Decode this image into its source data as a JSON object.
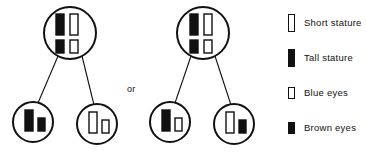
{
  "colors": {
    "stroke": "#111111",
    "dominant_fill": "#111111",
    "recessive_fill": "#ffffff",
    "background": "#ffffff"
  },
  "connector": {
    "or_label": "or"
  },
  "legend": {
    "items": [
      {
        "key": "short-stature",
        "label": "Short stature",
        "allele_type": "stature",
        "fill": "#ffffff",
        "swatch": "tall-bar-outline"
      },
      {
        "key": "tall-stature",
        "label": "Tall stature",
        "allele_type": "stature",
        "fill": "#111111",
        "swatch": "tall-bar-filled"
      },
      {
        "key": "blue-eyes",
        "label": "Blue eyes",
        "allele_type": "eye-color",
        "fill": "#ffffff",
        "swatch": "short-bar-outline"
      },
      {
        "key": "brown-eyes",
        "label": "Brown eyes",
        "allele_type": "eye-color",
        "fill": "#111111",
        "swatch": "short-bar-filled"
      }
    ]
  },
  "families": [
    {
      "key": "family-left",
      "parent": {
        "key": "parent-left",
        "cx": 70,
        "cy": 33,
        "r": 26,
        "chromosomes": [
          {
            "key": "stature-allele-1",
            "trait": "stature",
            "fill": "#111111",
            "x": 56,
            "y": 14,
            "w": 8,
            "h": 21
          },
          {
            "key": "stature-allele-2",
            "trait": "stature",
            "fill": "#ffffff",
            "x": 70,
            "y": 14,
            "w": 8,
            "h": 21
          },
          {
            "key": "eye-allele-1",
            "trait": "eye-color",
            "fill": "#111111",
            "x": 56,
            "y": 40,
            "w": 8,
            "h": 13
          },
          {
            "key": "eye-allele-2",
            "trait": "eye-color",
            "fill": "#ffffff",
            "x": 70,
            "y": 40,
            "w": 8,
            "h": 13
          }
        ]
      },
      "children": [
        {
          "key": "child-left-1",
          "cx": 33,
          "cy": 122,
          "r": 20,
          "chromosomes": [
            {
              "key": "stature-allele",
              "trait": "stature",
              "fill": "#111111",
              "x": 25,
              "y": 110,
              "w": 8,
              "h": 21
            },
            {
              "key": "eye-allele",
              "trait": "eye-color",
              "fill": "#111111",
              "x": 38,
              "y": 118,
              "w": 7,
              "h": 13
            }
          ]
        },
        {
          "key": "child-left-2",
          "cx": 97,
          "cy": 124,
          "r": 20,
          "chromosomes": [
            {
              "key": "stature-allele",
              "trait": "stature",
              "fill": "#ffffff",
              "x": 89,
              "y": 112,
              "w": 8,
              "h": 21
            },
            {
              "key": "eye-allele",
              "trait": "eye-color",
              "fill": "#ffffff",
              "x": 102,
              "y": 120,
              "w": 7,
              "h": 13
            }
          ]
        }
      ]
    },
    {
      "key": "family-right",
      "parent": {
        "key": "parent-right",
        "cx": 203,
        "cy": 33,
        "r": 26,
        "chromosomes": [
          {
            "key": "stature-allele-1",
            "trait": "stature",
            "fill": "#111111",
            "x": 190,
            "y": 14,
            "w": 8,
            "h": 21
          },
          {
            "key": "stature-allele-2",
            "trait": "stature",
            "fill": "#ffffff",
            "x": 204,
            "y": 14,
            "w": 8,
            "h": 21
          },
          {
            "key": "eye-allele-1",
            "trait": "eye-color",
            "fill": "#111111",
            "x": 190,
            "y": 40,
            "w": 8,
            "h": 13
          },
          {
            "key": "eye-allele-2",
            "trait": "eye-color",
            "fill": "#ffffff",
            "x": 204,
            "y": 40,
            "w": 8,
            "h": 13
          }
        ]
      },
      "children": [
        {
          "key": "child-right-1",
          "cx": 170,
          "cy": 122,
          "r": 20,
          "chromosomes": [
            {
              "key": "stature-allele",
              "trait": "stature",
              "fill": "#111111",
              "x": 162,
              "y": 110,
              "w": 8,
              "h": 21
            },
            {
              "key": "eye-allele",
              "trait": "eye-color",
              "fill": "#ffffff",
              "x": 175,
              "y": 118,
              "w": 7,
              "h": 13
            }
          ]
        },
        {
          "key": "child-right-2",
          "cx": 234,
          "cy": 124,
          "r": 20,
          "chromosomes": [
            {
              "key": "stature-allele",
              "trait": "stature",
              "fill": "#ffffff",
              "x": 226,
              "y": 112,
              "w": 8,
              "h": 21
            },
            {
              "key": "eye-allele",
              "trait": "eye-color",
              "fill": "#111111",
              "x": 239,
              "y": 120,
              "w": 7,
              "h": 13
            }
          ]
        }
      ]
    }
  ]
}
